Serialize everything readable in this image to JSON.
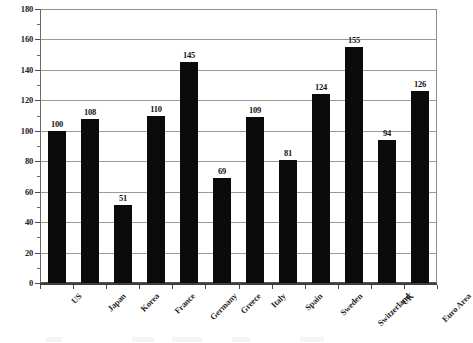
{
  "chart_data": {
    "type": "bar",
    "title": "",
    "subtitle": "",
    "xlabel": "",
    "ylabel": "",
    "ylim": [
      0,
      180
    ],
    "ytick_step": 20,
    "yticks": [
      0,
      20,
      40,
      60,
      80,
      100,
      120,
      140,
      160,
      180
    ],
    "ytick_labels": [
      "0",
      "20",
      "40",
      "60",
      "80",
      "100",
      "120",
      "140",
      "160",
      "180"
    ],
    "grid": "horizontal",
    "legend": "none",
    "bar_color": "#0b0b0b",
    "background_color": "#ffffff",
    "categories": [
      "US",
      "Japan",
      "Korea",
      "France",
      "Germany",
      "Greece",
      "Italy",
      "Spain",
      "Sweden",
      "Switzerland",
      "UK",
      "Euro Area"
    ],
    "values": [
      100,
      108,
      51,
      110,
      145,
      69,
      109,
      81,
      124,
      155,
      94,
      126
    ],
    "value_labels": [
      "100",
      "108",
      "51",
      "110",
      "145",
      "69",
      "109",
      "81",
      "124",
      "155",
      "94",
      "126"
    ],
    "xlabel_rotation_deg": -45,
    "data_labels_shown": true
  }
}
